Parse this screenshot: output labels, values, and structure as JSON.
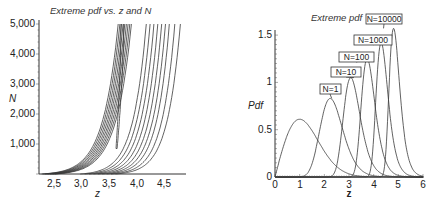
{
  "chart_data": [
    {
      "type": "line",
      "subtype": "contour",
      "title": "Extreme pdf vs. z and N",
      "xlabel": "z",
      "ylabel": "N",
      "xlim": [
        2.25,
        4.9
      ],
      "ylim": [
        0,
        5000
      ],
      "xticks": [
        "2,5",
        "3,0",
        "3,5",
        "4,0",
        "4,5"
      ],
      "xtick_values": [
        2.5,
        3.0,
        3.5,
        4.0,
        4.5
      ],
      "yticks": [
        "1,000",
        "2,000",
        "3,000",
        "4,000",
        "5,000"
      ],
      "ytick_values": [
        1000,
        2000,
        3000,
        4000,
        5000
      ],
      "grid": false,
      "contour_levels_left_group_z_at_N5000": [
        3.69,
        3.72,
        3.75,
        3.78,
        3.81,
        3.84,
        3.87,
        3.9,
        3.93
      ],
      "contour_levels_right_group_z_at_N5000": [
        4.2,
        4.27,
        4.34,
        4.41,
        4.48,
        4.55,
        4.62,
        4.72,
        4.82
      ],
      "closed_contour_tip": {
        "z": 3.65,
        "N": 850
      }
    },
    {
      "type": "line",
      "title": "Extreme pdf",
      "xlabel": "z",
      "ylabel": "Pdf",
      "xlim": [
        0,
        6
      ],
      "ylim": [
        0,
        1.6
      ],
      "xticks": [
        "0",
        "1",
        "2",
        "3",
        "4",
        "5",
        "6"
      ],
      "xtick_values": [
        0,
        1,
        2,
        3,
        4,
        5,
        6
      ],
      "yticks": [
        "0",
        "0.5",
        "1",
        "1.5"
      ],
      "ytick_values": [
        0,
        0.5,
        1,
        1.5
      ],
      "grid": false,
      "series": [
        {
          "name": "base",
          "label": "",
          "peak_z": 1.0,
          "peak_pdf": 0.61,
          "M": 1
        },
        {
          "name": "N=1",
          "label": "N=1",
          "peak_z": 2.3,
          "peak_pdf": 0.83,
          "M": 10
        },
        {
          "name": "N=10",
          "label": "N=10",
          "peak_z": 3.2,
          "peak_pdf": 1.05,
          "M": 100
        },
        {
          "name": "N=100",
          "label": "N=100",
          "peak_z": 3.8,
          "peak_pdf": 1.25,
          "M": 1000
        },
        {
          "name": "N=1000",
          "label": "N=1000",
          "peak_z": 4.1,
          "peak_pdf": 1.42,
          "M": 10000
        },
        {
          "name": "N=10000",
          "label": "N=10000",
          "peak_z": 4.4,
          "peak_pdf": 1.57,
          "M": 100000
        }
      ]
    }
  ],
  "left": {
    "title": "Extreme pdf vs. z and N",
    "xlabel": "z",
    "ylabel": "N",
    "xticks": [
      "2,5",
      "3,0",
      "3,5",
      "4,0",
      "4,5"
    ],
    "yticks": [
      "1,000",
      "2,000",
      "3,000",
      "4,000",
      "5,000"
    ]
  },
  "right": {
    "title": "Extreme pdf",
    "xlabel": "z",
    "ylabel": "Pdf",
    "xticks": [
      "0",
      "1",
      "2",
      "3",
      "4",
      "5",
      "6"
    ],
    "yticks": [
      "0",
      "0.5",
      "1",
      "1.5"
    ],
    "labels": [
      "N=1",
      "N=10",
      "N=100",
      "N=1000",
      "N=10000"
    ]
  }
}
